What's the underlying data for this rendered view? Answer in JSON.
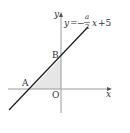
{
  "diagram": {
    "type": "coordinate-plane",
    "axes": {
      "x_label": "x",
      "y_label": "y",
      "origin_label": "O"
    },
    "line": {
      "equation_lhs": "y",
      "equals": "=",
      "minus": "−",
      "fraction_numerator": "a",
      "fraction_denominator": "2",
      "variable": "x",
      "constant": "+5"
    },
    "points": [
      {
        "label": "A",
        "description": "x-intercept of line"
      },
      {
        "label": "B",
        "description": "y-intercept of line"
      },
      {
        "label": "O",
        "description": "origin"
      }
    ],
    "shaded_region": "triangle AOB",
    "colors": {
      "line": "#1a1a1a",
      "axis": "#9a9a9a",
      "shade": "#e6e6e6",
      "text": "#333333"
    }
  }
}
